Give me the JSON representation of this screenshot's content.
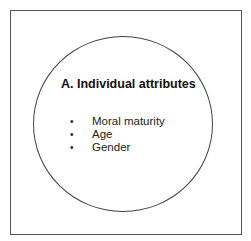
{
  "diagram": {
    "title": "A. Individual attributes",
    "items": [
      {
        "bullet": "•",
        "label": "Moral maturity"
      },
      {
        "bullet": "•",
        "label": "Age"
      },
      {
        "bullet": "•",
        "label": "Gender"
      }
    ]
  }
}
